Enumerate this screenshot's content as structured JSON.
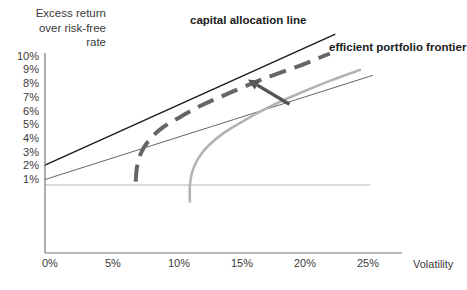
{
  "figure": {
    "title_block": "Excess return\nover risk-free\nrate",
    "x_axis_name": "Volatility",
    "labels": {
      "capital_allocation_line": "capital allocation line",
      "efficient_portfolio_frontier": "efficient portfolio frontier"
    },
    "colors": {
      "axis": "#777777",
      "capital_allocation_line": "#1a1a1a",
      "secondary_line": "#555555",
      "efficient_frontier_dashed": "#666666",
      "inefficient_frontier": "#b3b3b3",
      "zero_line": "#aaaaaa",
      "arrow": "#555555",
      "text": "#3a3a3a"
    }
  },
  "chart_data": {
    "type": "line",
    "title": "",
    "xlabel": "Volatility",
    "ylabel": "Excess return over risk-free rate",
    "xlim": [
      0,
      27
    ],
    "ylim": [
      0,
      11
    ],
    "grid": false,
    "legend_position": "inline-annotations",
    "x_ticks": [
      "0%",
      "5%",
      "10%",
      "15%",
      "20%",
      "25%"
    ],
    "x_tick_values": [
      0,
      5,
      10,
      15,
      20,
      25
    ],
    "y_ticks": [
      "1%",
      "2%",
      "3%",
      "4%",
      "5%",
      "6%",
      "7%",
      "8%",
      "9%",
      "10%"
    ],
    "y_tick_values": [
      1,
      2,
      3,
      4,
      5,
      6,
      7,
      8,
      9,
      10
    ],
    "annotations": [
      {
        "text": "capital allocation line",
        "x": 12.0,
        "y": 10.8,
        "style": "bold"
      },
      {
        "text": "efficient portfolio frontier",
        "x": 22.5,
        "y": 9.0,
        "style": "bold"
      },
      {
        "type": "arrow",
        "from_x": 19.4,
        "from_y": 6.5,
        "to_x": 16.1,
        "to_y": 8.3,
        "points_to": "efficient portfolio frontier"
      }
    ],
    "series": [
      {
        "name": "capital allocation line",
        "style": "solid",
        "color": "#1a1a1a",
        "width": 1.4,
        "points": [
          [
            0,
            2.05
          ],
          [
            23.0,
            11.6
          ]
        ]
      },
      {
        "name": "secondary allocation line",
        "style": "solid",
        "color": "#555555",
        "width": 0.9,
        "points": [
          [
            0,
            1.0
          ],
          [
            26.0,
            8.6
          ]
        ]
      },
      {
        "name": "efficient portfolio frontier",
        "style": "dashed",
        "color": "#666666",
        "width": 4.0,
        "points": [
          [
            7.2,
            0.85
          ],
          [
            7.3,
            1.9
          ],
          [
            7.6,
            2.9
          ],
          [
            8.2,
            3.8
          ],
          [
            9.2,
            4.7
          ],
          [
            10.6,
            5.5
          ],
          [
            12.4,
            6.4
          ],
          [
            14.6,
            7.3
          ],
          [
            17.2,
            8.3
          ],
          [
            20.2,
            9.3
          ],
          [
            22.6,
            10.2
          ]
        ]
      },
      {
        "name": "inefficient portfolio frontier",
        "style": "solid",
        "color": "#b3b3b3",
        "width": 2.6,
        "points": [
          [
            11.5,
            -0.6
          ],
          [
            11.5,
            0.6
          ],
          [
            11.7,
            1.6
          ],
          [
            12.2,
            2.6
          ],
          [
            13.0,
            3.5
          ],
          [
            14.2,
            4.4
          ],
          [
            15.8,
            5.3
          ],
          [
            17.8,
            6.3
          ],
          [
            20.2,
            7.3
          ],
          [
            22.6,
            8.2
          ],
          [
            25.0,
            9.0
          ]
        ]
      },
      {
        "name": "zero excess return line",
        "style": "solid",
        "color": "#aaaaaa",
        "width": 0.9,
        "points": [
          [
            0,
            0.6
          ],
          [
            25.8,
            0.6
          ]
        ]
      }
    ]
  }
}
